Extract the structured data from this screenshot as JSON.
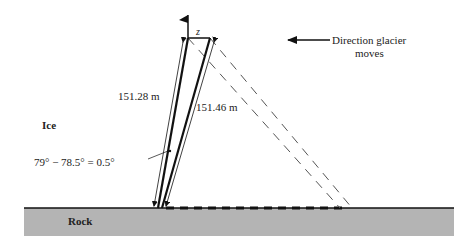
{
  "diagram": {
    "labels": {
      "z": "z",
      "left_length": "151.28 m",
      "right_length": "151.46 m",
      "ice": "Ice",
      "angle_eq": "79° − 78.5° = 0.5°",
      "rock": "Rock",
      "direction_line1": "Direction glacier",
      "direction_line2": "moves"
    },
    "colors": {
      "rock_fill": "#b4b4b4",
      "line": "#111111",
      "dashed": "#555555"
    }
  }
}
